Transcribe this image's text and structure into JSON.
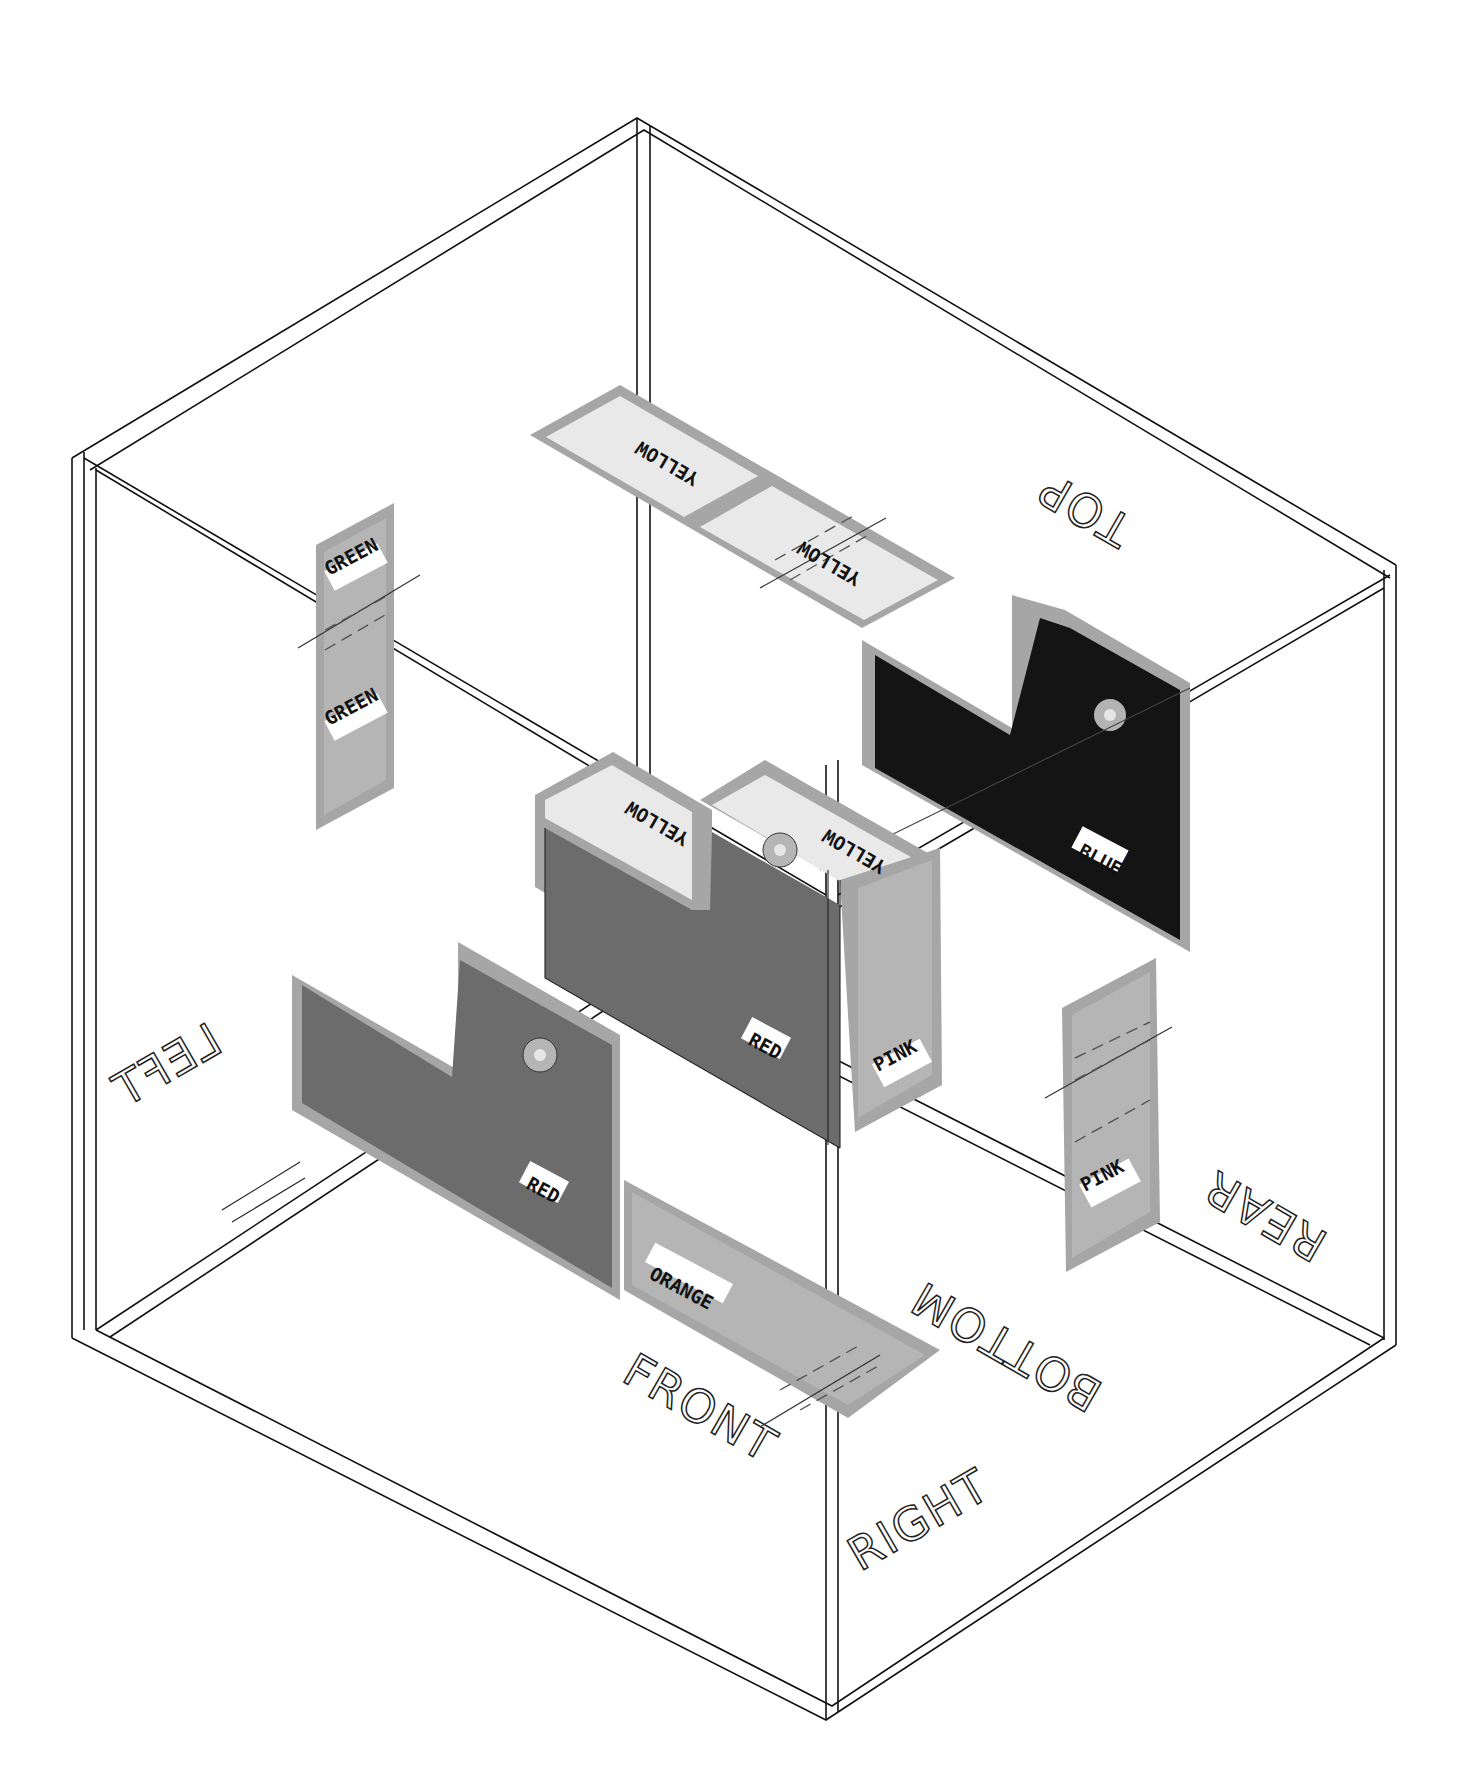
{
  "diagram": {
    "type": "isometric exploded assembly drawing",
    "box": {
      "face_labels": {
        "top": "TOP",
        "left": "LEFT",
        "front": "FRONT",
        "right": "RIGHT",
        "rear": "REAR",
        "bottom": "BOTTOM"
      }
    },
    "pieces": [
      {
        "id": "yellow-strip-top",
        "labels": [
          "YELLOW",
          "YELLOW"
        ]
      },
      {
        "id": "green-strip-left",
        "labels": [
          "GREEN",
          "GREEN"
        ]
      },
      {
        "id": "blue-notched-plate",
        "label": "BLUE"
      },
      {
        "id": "red-notched-block",
        "label": "RED",
        "top_labels": [
          "YELLOW",
          "YELLOW"
        ],
        "side_label": "PINK"
      },
      {
        "id": "red-notched-plate",
        "label": "RED"
      },
      {
        "id": "orange-strip-bottom",
        "label": "ORANGE"
      },
      {
        "id": "pink-strip-right",
        "label": "PINK"
      }
    ],
    "colors": {
      "rim": "#a6a6a6",
      "light_panel": "#e9e9e9",
      "red_panel": "#6c6c6c",
      "blue_panel": "#141414",
      "pink_panel": "#b5b5b5",
      "line": "#111111"
    }
  }
}
